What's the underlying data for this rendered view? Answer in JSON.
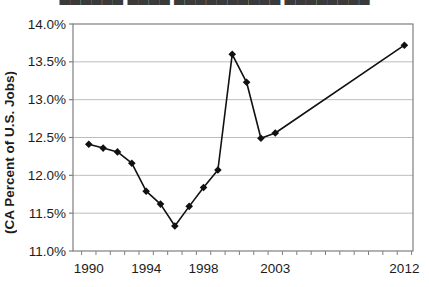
{
  "cropped_title": {
    "text": "██████ ████ ██████████ ████████"
  },
  "chart_data": {
    "type": "line",
    "ylabel": "(CA Percent of U.S. Jobs)",
    "x": [
      1990,
      1991,
      1992,
      1993,
      1994,
      1995,
      1996,
      1997,
      1998,
      1999,
      2000,
      2001,
      2002,
      2003,
      2012
    ],
    "values": [
      12.41,
      12.36,
      12.31,
      12.16,
      11.79,
      11.62,
      11.33,
      11.59,
      11.84,
      12.07,
      13.6,
      13.23,
      12.49,
      12.56,
      13.72
    ],
    "series_name": "CA percent of U.S. jobs",
    "x_tick_labels": [
      "1990",
      "1994",
      "1998",
      "2003",
      "2012"
    ],
    "x_tick_years": [
      1990,
      1994,
      1998,
      2003,
      2012
    ],
    "y_ticks": [
      {
        "label": "14.0%",
        "value": 14.0
      },
      {
        "label": "13.5%",
        "value": 13.5
      },
      {
        "label": "13.0%",
        "value": 13.0
      },
      {
        "label": "12.5%",
        "value": 12.5
      },
      {
        "label": "12.0%",
        "value": 12.0
      },
      {
        "label": "11.5%",
        "value": 11.5
      },
      {
        "label": "11.0%",
        "value": 11.0
      }
    ],
    "ylim": [
      11.0,
      14.0
    ],
    "xlim": [
      1988.9,
      2012.6
    ],
    "x_minor_tick_start": 1989.5,
    "x_minor_tick_end": 2012.5,
    "grid": "horizontal-only",
    "legend_position": "none",
    "marker": "filled-diamond",
    "colors": {
      "line": "#111111",
      "marker": "#111111",
      "gridline": "#bdbdbd",
      "plot_border": "#7f7f7f",
      "text": "#1c1c1c",
      "background": "#ffffff"
    }
  }
}
